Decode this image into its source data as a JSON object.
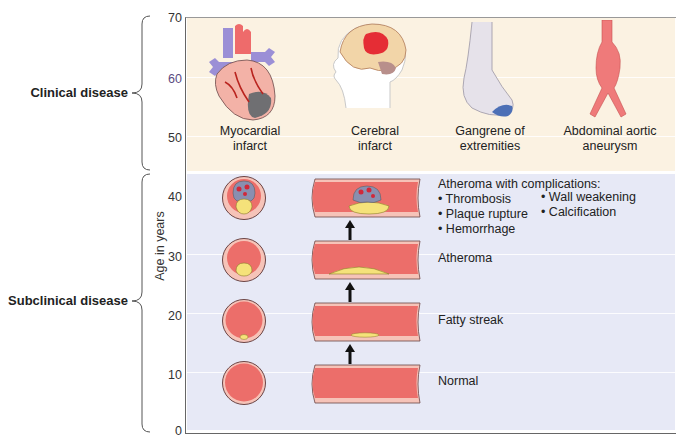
{
  "figure": {
    "axis": {
      "title": "Age in years",
      "ticks": [
        "70",
        "60",
        "50",
        "40",
        "30",
        "20",
        "10",
        "0"
      ]
    },
    "phases": [
      {
        "label": "Clinical disease"
      },
      {
        "label": "Subclinical disease"
      }
    ],
    "clinical_outcomes": [
      {
        "icon": "heart-infarct-icon",
        "line1": "Myocardial",
        "line2": "infarct"
      },
      {
        "icon": "brain-infarct-icon",
        "line1": "Cerebral",
        "line2": "infarct"
      },
      {
        "icon": "gangrene-foot-icon",
        "line1": "Gangrene of",
        "line2": "extremities"
      },
      {
        "icon": "aortic-aneurysm-icon",
        "line1": "Abdominal aortic",
        "line2": "aneurysm"
      }
    ],
    "stages": [
      {
        "label": "Atheroma with complications:",
        "bullets_col1": [
          "• Thrombosis",
          "• Plaque rupture",
          "• Hemorrhage"
        ],
        "bullets_col2": [
          "• Wall weakening",
          "• Calcification"
        ]
      },
      {
        "label": "Atheroma"
      },
      {
        "label": "Fatty streak"
      },
      {
        "label": "Normal"
      }
    ],
    "colors": {
      "clinical_bg": "#fbf2e2",
      "subclinical_bg": "#e7e9f6",
      "vessel_lumen": "#ec6e6a",
      "vessel_wall": "#f4b9ae",
      "plaque": "#f5e27a",
      "thrombus": "#8a8fb0"
    }
  }
}
